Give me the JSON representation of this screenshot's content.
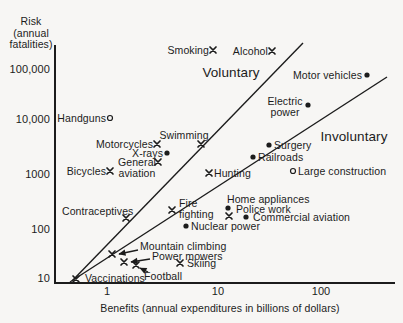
{
  "colors": {
    "background": "#f7f6f4",
    "ink": "#1c1c1c"
  },
  "chart_data": {
    "type": "scatter",
    "title": "",
    "y_axis": {
      "title_lines": [
        "Risk",
        "(annual",
        "fatalities)"
      ],
      "scale": "log",
      "range": [
        10,
        300000
      ],
      "ticks": [
        {
          "label": "100,000",
          "value": 100000,
          "y": 69
        },
        {
          "label": "10,000",
          "value": 10000,
          "y": 119
        },
        {
          "label": "1000",
          "value": 1000,
          "y": 174
        },
        {
          "label": "100",
          "value": 100,
          "y": 229
        },
        {
          "label": "10",
          "value": 10,
          "y": 278
        }
      ]
    },
    "x_axis": {
      "label": "Benefits (annual expenditures in billions of dollars)",
      "scale": "log",
      "range": [
        0.3,
        500
      ],
      "ticks": [
        {
          "label": "1",
          "value": 1,
          "x": 107
        },
        {
          "label": "10",
          "value": 10,
          "x": 218
        },
        {
          "label": "100",
          "value": 100,
          "x": 321
        }
      ]
    },
    "geometry": {
      "plot_left": 55,
      "plot_top": 45,
      "plot_right": 395,
      "plot_bottom": 283
    },
    "regions": [
      {
        "id": "voluntary",
        "label": "Voluntary",
        "cx": 231,
        "cy": 73,
        "line": [
          72,
          281,
          303,
          43
        ]
      },
      {
        "id": "involuntary",
        "label": "Involuntary",
        "cx": 354,
        "cy": 137,
        "line": [
          70,
          282,
          387,
          77
        ]
      }
    ],
    "points": [
      {
        "id": "smoking",
        "label": "Smoking",
        "marker": "x",
        "mx": 213,
        "my": 50,
        "lx": 209,
        "ly": 50,
        "align": "right",
        "benefit_billions": 10,
        "annual_fatalities": 200000
      },
      {
        "id": "alcohol",
        "label": "Alcohol",
        "marker": "x",
        "mx": 272,
        "my": 51,
        "lx": 268,
        "ly": 51,
        "align": "right",
        "benefit_billions": 36,
        "annual_fatalities": 200000
      },
      {
        "id": "motor-vehicles",
        "label": "Motor vehicles",
        "marker": "dot",
        "mx": 367,
        "my": 75,
        "lx": 362,
        "ly": 75,
        "align": "right",
        "benefit_billions": 280,
        "annual_fatalities": 80000
      },
      {
        "id": "electric-power",
        "label": "Electric\npower",
        "marker": "dot",
        "mx": 308,
        "my": 105,
        "lx": 285,
        "ly": 106,
        "align": "center",
        "benefit_billions": 80,
        "annual_fatalities": 21000
      },
      {
        "id": "handguns",
        "label": "Handguns",
        "marker": "circle",
        "mx": 110,
        "my": 118,
        "lx": 106,
        "ly": 118,
        "align": "right",
        "benefit_billions": 1.1,
        "annual_fatalities": 12000
      },
      {
        "id": "motorcycles",
        "label": "Motorcycles",
        "marker": "x",
        "mx": 157,
        "my": 144,
        "lx": 153,
        "ly": 144,
        "align": "right",
        "benefit_billions": 3,
        "annual_fatalities": 3700
      },
      {
        "id": "swimming",
        "label": "Swimming",
        "marker": "x",
        "mx": 201,
        "my": 144,
        "lx": 184,
        "ly": 135,
        "align": "center",
        "benefit_billions": 8,
        "annual_fatalities": 3700
      },
      {
        "id": "x-rays",
        "label": "X-rays",
        "marker": "dot",
        "mx": 167,
        "my": 153,
        "lx": 163,
        "ly": 153,
        "align": "right",
        "benefit_billions": 3.7,
        "annual_fatalities": 2600
      },
      {
        "id": "general-aviation",
        "label": "General\naviation",
        "marker": "x",
        "mx": 158,
        "my": 162,
        "lx": 137,
        "ly": 167,
        "align": "center",
        "benefit_billions": 3,
        "annual_fatalities": 1700
      },
      {
        "id": "bicycles",
        "label": "Bicycles",
        "marker": "x",
        "mx": 110,
        "my": 171,
        "lx": 106,
        "ly": 171,
        "align": "right",
        "benefit_billions": 1.1,
        "annual_fatalities": 1100
      },
      {
        "id": "hunting",
        "label": "Hunting",
        "marker": "x",
        "mx": 209,
        "my": 173,
        "lx": 214,
        "ly": 173,
        "align": "left",
        "benefit_billions": 9,
        "annual_fatalities": 1100
      },
      {
        "id": "surgery",
        "label": "Surgery",
        "marker": "dot",
        "mx": 269,
        "my": 145,
        "lx": 274,
        "ly": 145,
        "align": "left",
        "benefit_billions": 34,
        "annual_fatalities": 3700
      },
      {
        "id": "railroads",
        "label": "Railroads",
        "marker": "dot",
        "mx": 253,
        "my": 157,
        "lx": 258,
        "ly": 157,
        "align": "left",
        "benefit_billions": 24,
        "annual_fatalities": 2200
      },
      {
        "id": "large-construction",
        "label": "Large construction",
        "marker": "circle",
        "mx": 293,
        "my": 171,
        "lx": 298,
        "ly": 171,
        "align": "left",
        "benefit_billions": 57,
        "annual_fatalities": 1200
      },
      {
        "id": "contraceptives",
        "label": "Contraceptives",
        "marker": "x",
        "mx": 126,
        "my": 218,
        "lx": 62,
        "ly": 211,
        "align": "left",
        "benefit_billions": 1.5,
        "annual_fatalities": 150
      },
      {
        "id": "fire-fighting",
        "label": "Fire\nfighting",
        "marker": "x",
        "mx": 172,
        "my": 210,
        "lx": 179,
        "ly": 208,
        "align": "left",
        "benefit_billions": 4,
        "annual_fatalities": 220
      },
      {
        "id": "home-appliances",
        "label": "Home appliances",
        "marker": "dot",
        "mx": 228,
        "my": 208,
        "lx": 227,
        "ly": 199,
        "align": "left",
        "benefit_billions": 14,
        "annual_fatalities": 230
      },
      {
        "id": "police-work",
        "label": "Police work",
        "marker": "x",
        "mx": 229,
        "my": 216,
        "lx": 236,
        "ly": 209,
        "align": "left",
        "benefit_billions": 14,
        "annual_fatalities": 160
      },
      {
        "id": "commercial-aviation",
        "label": "Commercial aviation",
        "marker": "dot",
        "mx": 246,
        "my": 217,
        "lx": 253,
        "ly": 217,
        "align": "left",
        "benefit_billions": 20,
        "annual_fatalities": 155
      },
      {
        "id": "nuclear-power",
        "label": "Nuclear power",
        "marker": "dot",
        "mx": 186,
        "my": 226,
        "lx": 191,
        "ly": 226,
        "align": "left",
        "benefit_billions": 5.6,
        "annual_fatalities": 110
      },
      {
        "id": "mountain-climbing",
        "label": "Mountain climbing",
        "marker": "x",
        "mx": 112,
        "my": 254,
        "lx": 140,
        "ly": 246,
        "align": "left",
        "arrow": [
          138,
          250,
          119,
          254
        ],
        "benefit_billions": 1.1,
        "annual_fatalities": 32
      },
      {
        "id": "power-mowers",
        "label": "Power mowers",
        "marker": "x",
        "mx": 124,
        "my": 262,
        "lx": 152,
        "ly": 256,
        "align": "left",
        "arrow": [
          150,
          259,
          131,
          262
        ],
        "benefit_billions": 1.5,
        "annual_fatalities": 23
      },
      {
        "id": "football",
        "label": "Football",
        "marker": "x",
        "mx": 136,
        "my": 265,
        "lx": 144,
        "ly": 276,
        "align": "left",
        "arrow": [
          148,
          272,
          140,
          268
        ],
        "benefit_billions": 1.8,
        "annual_fatalities": 22
      },
      {
        "id": "skiing",
        "label": "Skiing",
        "marker": "x",
        "mx": 180,
        "my": 263,
        "lx": 187,
        "ly": 263,
        "align": "left",
        "benefit_billions": 4.9,
        "annual_fatalities": 22
      },
      {
        "id": "vaccinations",
        "label": "Vaccinations",
        "marker": "x",
        "mx": 76,
        "my": 279,
        "lx": 85,
        "ly": 278,
        "align": "left",
        "benefit_billions": 0.5,
        "annual_fatalities": 11
      }
    ],
    "xlabel_pos": {
      "cx": 220,
      "cy": 308
    },
    "ytitle_pos": {
      "cx": 31,
      "top": 16
    },
    "xtick_y": 291,
    "ytick_right": 50
  }
}
